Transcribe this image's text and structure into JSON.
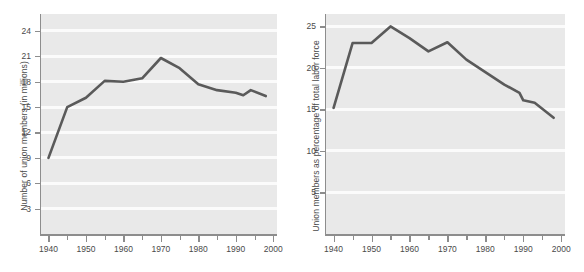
{
  "figure": {
    "background_color": "#ffffff",
    "plot_background_color": "#e9e9e9",
    "gridline_color": "#fbfbfb",
    "axis_color": "#8d8d8d",
    "line_color": "#5a5a5a",
    "text_color": "#4a4a4a"
  },
  "chart_data": [
    {
      "type": "line",
      "title": "",
      "xlabel": "",
      "ylabel": "Number of union members (in millions)",
      "xlim": [
        1938,
        2001
      ],
      "ylim": [
        0,
        26
      ],
      "grid": true,
      "legend": null,
      "xticks": [
        1940,
        1950,
        1960,
        1970,
        1980,
        1990,
        2000
      ],
      "xtick_labels": [
        "1940",
        "1950",
        "1960",
        "1970",
        "1980",
        "1990",
        "2000"
      ],
      "xminor_ticks": [
        1945,
        1955,
        1965,
        1975,
        1985,
        1995
      ],
      "yticks": [
        3,
        6,
        9,
        12,
        15,
        18,
        21,
        24
      ],
      "ytick_labels": [
        "3",
        "6",
        "9",
        "12",
        "15",
        "18",
        "21",
        "24"
      ],
      "x": [
        1940,
        1945,
        1950,
        1955,
        1960,
        1965,
        1970,
        1975,
        1980,
        1985,
        1990,
        1992,
        1994,
        1998
      ],
      "values": [
        9.0,
        15.0,
        16.1,
        18.1,
        18.0,
        18.4,
        20.8,
        19.6,
        17.7,
        17.0,
        16.7,
        16.4,
        17.0,
        16.3
      ]
    },
    {
      "type": "line",
      "title": "",
      "xlabel": "",
      "ylabel": "Union members as percentage of total labor force",
      "xlim": [
        1938,
        2001
      ],
      "ylim": [
        0,
        26.5
      ],
      "grid": true,
      "legend": null,
      "xticks": [
        1940,
        1950,
        1960,
        1970,
        1980,
        1990,
        2000
      ],
      "xtick_labels": [
        "1940",
        "1950",
        "1960",
        "1970",
        "1980",
        "1990",
        "2000"
      ],
      "xminor_ticks": [
        1945,
        1955,
        1965,
        1975,
        1985,
        1995
      ],
      "yticks": [
        5,
        10,
        15,
        20,
        25
      ],
      "ytick_labels": [
        "5",
        "10",
        "15",
        "20",
        "25"
      ],
      "x": [
        1940,
        1945,
        1950,
        1955,
        1960,
        1965,
        1970,
        1975,
        1980,
        1985,
        1989,
        1990,
        1993,
        1998
      ],
      "values": [
        15.2,
        23.0,
        23.0,
        25.0,
        23.6,
        22.0,
        23.1,
        21.0,
        19.5,
        18.0,
        17.0,
        16.1,
        15.8,
        14.0
      ]
    }
  ]
}
